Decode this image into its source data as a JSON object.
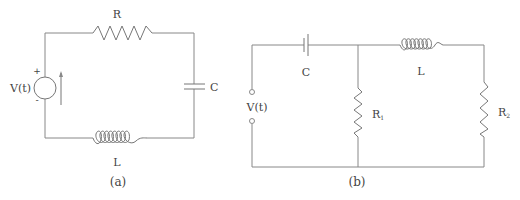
{
  "diagram_a": {
    "caption": "(a)",
    "resistor_label": "R",
    "capacitor_label": "C",
    "inductor_label": "L",
    "source_label": "V(t)",
    "source_plus": "+",
    "source_minus": "-"
  },
  "diagram_b": {
    "caption": "(b)",
    "capacitor_label": "C",
    "inductor_label": "L",
    "source_label": "V(t)",
    "r1_label": "R",
    "r1_sub": "1",
    "r2_label": "R",
    "r2_sub": "2"
  },
  "colors": {
    "wire": "#888888",
    "text": "#444444",
    "background": "#ffffff"
  }
}
